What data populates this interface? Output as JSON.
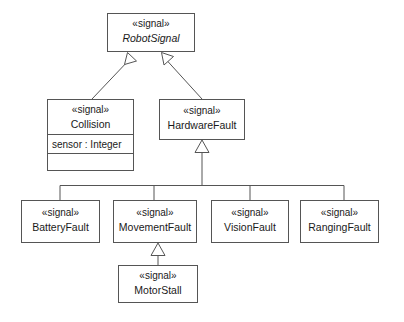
{
  "diagram": {
    "kind": "uml-class-diagram",
    "stereotype": "«signal»",
    "colors": {
      "background": "#ffffff",
      "stroke": "#555555",
      "text": "#1a1a1a",
      "fill": "#ffffff"
    },
    "classes": {
      "robot_signal": {
        "stereotype": "«signal»",
        "name": "RobotSignal",
        "abstract": true
      },
      "collision": {
        "stereotype": "«signal»",
        "name": "Collision",
        "abstract": false,
        "attributes": [
          "sensor : Integer"
        ],
        "operations": []
      },
      "hardware_fault": {
        "stereotype": "«signal»",
        "name": "HardwareFault",
        "abstract": false
      },
      "battery_fault": {
        "stereotype": "«signal»",
        "name": "BatteryFault",
        "abstract": false
      },
      "movement_fault": {
        "stereotype": "«signal»",
        "name": "MovementFault",
        "abstract": false
      },
      "vision_fault": {
        "stereotype": "«signal»",
        "name": "VisionFault",
        "abstract": false
      },
      "ranging_fault": {
        "stereotype": "«signal»",
        "name": "RangingFault",
        "abstract": false
      },
      "motor_stall": {
        "stereotype": "«signal»",
        "name": "MotorStall",
        "abstract": false
      }
    },
    "generalizations": [
      {
        "from": "collision",
        "to": "robot_signal"
      },
      {
        "from": "hardware_fault",
        "to": "robot_signal"
      },
      {
        "from": "battery_fault",
        "to": "hardware_fault"
      },
      {
        "from": "movement_fault",
        "to": "hardware_fault"
      },
      {
        "from": "vision_fault",
        "to": "hardware_fault"
      },
      {
        "from": "ranging_fault",
        "to": "hardware_fault"
      },
      {
        "from": "motor_stall",
        "to": "movement_fault"
      }
    ]
  }
}
